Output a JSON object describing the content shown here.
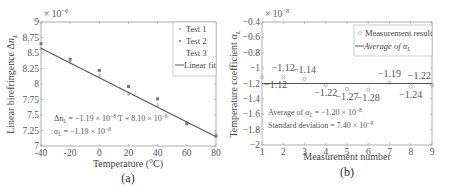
{
  "chart_data": [
    {
      "type": "scatter",
      "panel_label": "(a)",
      "title": "",
      "xlabel": "Temperature (°C)",
      "ylabel": "Linear birefringence Δn_L",
      "y_multiplier": "× 10^-6",
      "xlim": [
        -40,
        80
      ],
      "ylim": [
        7,
        9
      ],
      "xticks": [
        -40,
        -20,
        0,
        20,
        40,
        60,
        80
      ],
      "yticks": [
        7,
        7.25,
        7.5,
        7.75,
        8,
        8.25,
        8.5,
        8.75,
        9
      ],
      "xtick_labels": [
        "-40",
        "-20",
        "0",
        "20",
        "40",
        "60",
        "80"
      ],
      "ytick_labels": [
        "7",
        "7.25",
        "7.5",
        "7.75",
        "8",
        "8.25",
        "8.5",
        "8.75",
        "9"
      ],
      "grid": false,
      "legend_position": "top-right",
      "series": [
        {
          "name": "Test 1",
          "marker": "dot",
          "color": "#bbbbbb",
          "x": [
            -40,
            -20,
            0,
            20,
            40,
            60,
            80
          ],
          "y": [
            8.56,
            8.36,
            8.12,
            7.83,
            7.65,
            7.38,
            7.2
          ]
        },
        {
          "name": "Test 2",
          "marker": "square",
          "color": "#777777",
          "x": [
            -40,
            -20,
            0,
            20,
            40,
            60,
            80
          ],
          "y": [
            8.65,
            8.4,
            8.22,
            7.96,
            7.76,
            7.36,
            7.16
          ]
        },
        {
          "name": "Test 3",
          "marker": "none",
          "color": "#999999",
          "x": [
            -40,
            -20,
            0,
            20,
            40,
            60,
            80
          ],
          "y": [
            8.58,
            8.38,
            8.16,
            7.86,
            7.68,
            7.34,
            7.18
          ]
        },
        {
          "name": "Linear fit",
          "marker": "line",
          "color": "#555555",
          "x": [
            -40,
            80
          ],
          "y": [
            8.576,
            7.148
          ]
        }
      ],
      "annotations": [
        {
          "label": "fit_equation",
          "text": "Δn_L = −1.19 × 10^-8 T + 8.10 × 10^-6"
        },
        {
          "label": "alpha",
          "text": "α_L = −1.19 × 10^-8"
        }
      ]
    },
    {
      "type": "scatter",
      "panel_label": "(b)",
      "title": "",
      "xlabel": "Measurement number",
      "ylabel": "Temperature coefficient α_L",
      "y_multiplier": "× 10^-8",
      "xlim": [
        1,
        9
      ],
      "ylim": [
        -2,
        -0.4
      ],
      "xticks": [
        1,
        2,
        3,
        4,
        5,
        6,
        7,
        8,
        9
      ],
      "yticks": [
        -2,
        -1.8,
        -1.6,
        -1.4,
        -1.2,
        -1,
        -0.8,
        -0.6,
        -0.4
      ],
      "xtick_labels": [
        "1",
        "2",
        "3",
        "4",
        "5",
        "6",
        "7",
        "8",
        "9"
      ],
      "ytick_labels": [
        "−2",
        "−1.8",
        "−1.6",
        "−1.4",
        "−1.2",
        "−1",
        "−0.8",
        "−0.6",
        "−0.4"
      ],
      "grid": false,
      "legend_position": "top-right",
      "series": [
        {
          "name": "Measurement result",
          "marker": "circle",
          "color": "#999999",
          "x": [
            1,
            2,
            3,
            4,
            5,
            6,
            7,
            8,
            9
          ],
          "y": [
            -1.12,
            -1.12,
            -1.14,
            -1.22,
            -1.27,
            -1.28,
            -1.19,
            -1.24,
            -1.22
          ]
        },
        {
          "name": "Average of α_L",
          "marker": "line",
          "color": "#555555",
          "x": [
            1,
            9
          ],
          "y": [
            -1.2,
            -1.2
          ]
        }
      ],
      "data_labels": [
        {
          "x": 1,
          "text": "−1.12",
          "pos": "below"
        },
        {
          "x": 2,
          "text": "−1.12",
          "pos": "above"
        },
        {
          "x": 3,
          "text": "−1.14",
          "pos": "above"
        },
        {
          "x": 4,
          "text": "−1.22",
          "pos": "below"
        },
        {
          "x": 5,
          "text": "−1.27",
          "pos": "below"
        },
        {
          "x": 6,
          "text": "−1.28",
          "pos": "below"
        },
        {
          "x": 7,
          "text": "−1.19",
          "pos": "above"
        },
        {
          "x": 8,
          "text": "−1.24",
          "pos": "below"
        },
        {
          "x": 9,
          "text": "−1.22",
          "pos": "above"
        }
      ],
      "annotations": [
        {
          "label": "average",
          "text": "Average of α_L = −1.20 × 10^-8"
        },
        {
          "label": "std",
          "text": "Standard deviation = 7.40 × 10^-9"
        }
      ]
    }
  ],
  "labels": {
    "a": {
      "multiplier_base": "× 10",
      "multiplier_exp": "−6",
      "ylabel_main": "Linear birefringence Δ",
      "ylabel_var": "n",
      "ylabel_sub": "L",
      "xlabel": "Temperature (°C)",
      "caption": "(a)",
      "legend": [
        "Test 1",
        "Test 2",
        "Test 3",
        "Linear fit"
      ],
      "eq1_pre": "Δn",
      "eq1_sub": "L",
      "eq1_mid": " = −1.19 × 10",
      "eq1_exp1": "−8",
      "eq1_post": "T + 8.10 × 10",
      "eq1_exp2": "−6",
      "eq2_pre": "α",
      "eq2_sub": "L",
      "eq2_mid": " = −1.19 × 10",
      "eq2_exp": "−8"
    },
    "b": {
      "multiplier_base": "× 10",
      "multiplier_exp": "−8",
      "ylabel_main": "Temperature coefficient ",
      "ylabel_var": "α",
      "ylabel_sub": "L",
      "xlabel": "Measurement number",
      "caption": "(b)",
      "legend_1": "Measurement result",
      "legend_2_pre": "Average of ",
      "legend_2_var": "α",
      "legend_2_sub": "L",
      "avg_pre": "Average of ",
      "avg_var": "α",
      "avg_sub": "L",
      "avg_post": " = −1.20 × 10",
      "avg_exp": "−8",
      "std_pre": "Standard deviation = 7.40 × 10",
      "std_exp": "−9"
    }
  }
}
